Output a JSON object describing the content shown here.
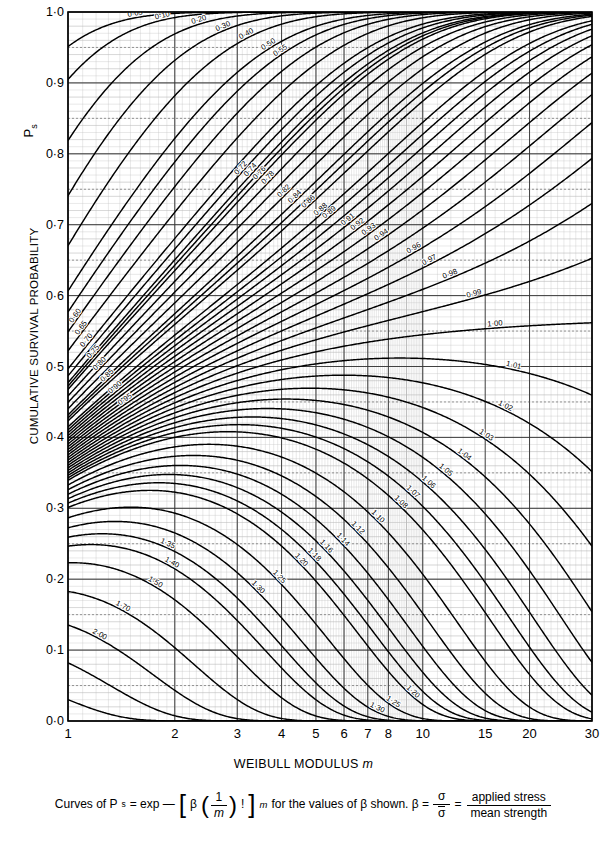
{
  "chart_data": {
    "type": "line",
    "title": "",
    "xlabel": "WEIBULL MODULUS m",
    "ylabel": "CUMULATIVE SURVIVAL PROBABILITY",
    "y_symbol": "Ps",
    "xscale": "log",
    "xlim": [
      1,
      30
    ],
    "ylim": [
      0.0,
      1.0
    ],
    "grid": true,
    "legend": "inline curve labels",
    "x_ticks": [
      "1",
      "2",
      "3",
      "4",
      "5",
      "6",
      "7",
      "8",
      "10",
      "15",
      "20",
      "30"
    ],
    "x_tick_values": [
      1,
      2,
      3,
      4,
      5,
      6,
      7,
      8,
      10,
      15,
      20,
      30
    ],
    "y_ticks": [
      "0·0",
      "0·1",
      "0·2",
      "0·3",
      "0·4",
      "0·5",
      "0·6",
      "0·7",
      "0·8",
      "0·9",
      "1·0"
    ],
    "y_tick_values": [
      0.0,
      0.1,
      0.2,
      0.3,
      0.4,
      0.5,
      0.6,
      0.7,
      0.8,
      0.9,
      1.0
    ],
    "series_parameter": "beta",
    "equation": "Ps = exp(-[beta*(1/m)!]^m)",
    "series": [
      {
        "name": "0·05",
        "beta": 0.05,
        "label_m": 1.55
      },
      {
        "name": "0·10",
        "beta": 0.1,
        "label_m": 1.85
      },
      {
        "name": "0·20",
        "beta": 0.2,
        "label_m": 2.35
      },
      {
        "name": "0·30",
        "beta": 0.3,
        "label_m": 2.75
      },
      {
        "name": "0·40",
        "beta": 0.4,
        "label_m": 3.2
      },
      {
        "name": "0·50",
        "beta": 0.5,
        "label_m": 3.7
      },
      {
        "name": "0·55",
        "beta": 0.55,
        "label_m": 4.0
      },
      {
        "name": "0·60",
        "beta": 0.6,
        "label_m": 1.06
      },
      {
        "name": "0·65",
        "beta": 0.65,
        "label_m": 1.1
      },
      {
        "name": "0·70",
        "beta": 0.7,
        "label_m": 1.14
      },
      {
        "name": "0·72",
        "beta": 0.72,
        "label_m": 3.1
      },
      {
        "name": "0·74",
        "beta": 0.74,
        "label_m": 3.3
      },
      {
        "name": "0·75",
        "beta": 0.75,
        "label_m": 1.19
      },
      {
        "name": "0·76",
        "beta": 0.76,
        "label_m": 3.5
      },
      {
        "name": "0·78",
        "beta": 0.78,
        "label_m": 3.7
      },
      {
        "name": "0·80",
        "beta": 0.8,
        "label_m": 1.24
      },
      {
        "name": "0·82",
        "beta": 0.82,
        "label_m": 4.1
      },
      {
        "name": "0·84",
        "beta": 0.84,
        "label_m": 4.4
      },
      {
        "name": "0·85",
        "beta": 0.85,
        "label_m": 1.3
      },
      {
        "name": "0·86",
        "beta": 0.86,
        "label_m": 4.8
      },
      {
        "name": "0·88",
        "beta": 0.88,
        "label_m": 5.2
      },
      {
        "name": "0·89",
        "beta": 0.89,
        "label_m": 5.5
      },
      {
        "name": "0·90",
        "beta": 0.9,
        "label_m": 1.37
      },
      {
        "name": "0·91",
        "beta": 0.91,
        "label_m": 6.2
      },
      {
        "name": "0·92",
        "beta": 0.92,
        "label_m": 6.6
      },
      {
        "name": "0·93",
        "beta": 0.93,
        "label_m": 7.1
      },
      {
        "name": "0·94",
        "beta": 0.94,
        "label_m": 7.7
      },
      {
        "name": "0·95",
        "beta": 0.95,
        "label_m": 1.46
      },
      {
        "name": "0·96",
        "beta": 0.96,
        "label_m": 9.5
      },
      {
        "name": "0·97",
        "beta": 0.97,
        "label_m": 10.5
      },
      {
        "name": "0·98",
        "beta": 0.98,
        "label_m": 12.0
      },
      {
        "name": "0·99",
        "beta": 0.99,
        "label_m": 14.0
      },
      {
        "name": "1·00",
        "beta": 1.0,
        "label_m": 16.0
      },
      {
        "name": "1·01",
        "beta": 1.01,
        "label_m": 18.0
      },
      {
        "name": "1·02",
        "beta": 1.02,
        "label_m": 17.0
      },
      {
        "name": "1·03",
        "beta": 1.03,
        "label_m": 15.0
      },
      {
        "name": "1·04",
        "beta": 1.04,
        "label_m": 13.0
      },
      {
        "name": "1·05",
        "beta": 1.05,
        "label_m": 11.5
      },
      {
        "name": "1·06",
        "beta": 1.06,
        "label_m": 10.3
      },
      {
        "name": "1·07",
        "beta": 1.07,
        "label_m": 9.3
      },
      {
        "name": "1·08",
        "beta": 1.08,
        "label_m": 8.6
      },
      {
        "name": "1·10",
        "beta": 1.1,
        "label_m": 7.4
      },
      {
        "name": "1·12",
        "beta": 1.12,
        "label_m": 6.5
      },
      {
        "name": "1·14",
        "beta": 1.14,
        "label_m": 5.9
      },
      {
        "name": "1·16",
        "beta": 1.16,
        "label_m": 5.3
      },
      {
        "name": "1·18",
        "beta": 1.18,
        "label_m": 4.9
      },
      {
        "name": "1·20",
        "beta": 1.2,
        "label_m": 4.5
      },
      {
        "name": "1·25",
        "beta": 1.25,
        "label_m": 3.9
      },
      {
        "name": "1·30",
        "beta": 1.3,
        "label_m": 3.4
      },
      {
        "name": "1·35",
        "beta": 1.35,
        "label_m": 1.9
      },
      {
        "name": "1·40",
        "beta": 1.4,
        "label_m": 1.95
      },
      {
        "name": "1·50",
        "beta": 1.5,
        "label_m": 1.75
      },
      {
        "name": "1·70",
        "beta": 1.7,
        "label_m": 1.42
      },
      {
        "name": "2·00",
        "beta": 2.0,
        "label_m": 1.22
      },
      {
        "name": "2·50",
        "beta": 2.5,
        "label_m": 2.5
      },
      {
        "name": "3·50",
        "beta": 3.5,
        "label_m": 2.2
      }
    ],
    "extra_labels": [
      {
        "name": "1·20",
        "beta": 1.2,
        "m": 9.3
      },
      {
        "name": "2·00",
        "beta": 2.0,
        "m": 5.2
      },
      {
        "name": "1·30",
        "beta": 1.3,
        "m": 7.4
      },
      {
        "name": "1·25",
        "beta": 1.25,
        "m": 8.2
      }
    ]
  },
  "caption": {
    "lead": "Curves of P",
    "lead_sub": "s",
    "eq1": "= exp —",
    "beta1": "β",
    "frac_num": "1",
    "frac_den": "m",
    "fact": "!",
    "exp_m": "m",
    "mid": "for the values of β shown. β =",
    "ratio_num": "σ",
    "ratio_den": "σ",
    "equals": "=",
    "words_num": "applied stress",
    "words_den": "mean strength"
  },
  "axes": {
    "y_title": "CUMULATIVE SURVIVAL PROBABILITY",
    "y_symbol_main": "P",
    "y_symbol_sub": "s",
    "x_title_main": "WEIBULL MODULUS",
    "x_title_italic": "m"
  },
  "colors": {
    "curve": "#000000",
    "major_grid": "#444444",
    "minor_grid": "#aaaaaa",
    "frame": "#000000",
    "background": "#ffffff"
  },
  "plot_box": {
    "left": 68,
    "top": 12,
    "right": 592,
    "bottom": 721
  }
}
